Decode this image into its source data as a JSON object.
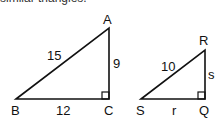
{
  "header": {
    "cut_text": "similar triangles."
  },
  "triangle1": {
    "vertices": {
      "A": "A",
      "B": "B",
      "C": "C"
    },
    "sides": {
      "AB": "15",
      "AC": "9",
      "BC": "12"
    }
  },
  "triangle2": {
    "vertices": {
      "R": "R",
      "S": "S",
      "Q": "Q"
    },
    "sides": {
      "RS": "10",
      "RQ": "s",
      "SQ": "r"
    }
  },
  "colors": {
    "stroke": "#111111",
    "background": "#ffffff"
  }
}
